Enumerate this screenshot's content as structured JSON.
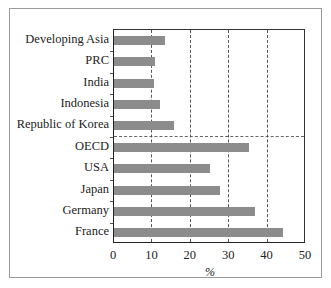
{
  "chart_data": {
    "type": "bar",
    "orientation": "horizontal",
    "title": "",
    "xlabel": "%",
    "ylabel": "",
    "xlim": [
      0,
      50
    ],
    "xticks": [
      0,
      10,
      20,
      30,
      40,
      50
    ],
    "xtick_labels": [
      "0",
      "10",
      "20",
      "30",
      "40",
      "50"
    ],
    "grid": "vertical dashed at 10, 20, 30, 40",
    "separator": "horizontal dashed line between Republic of Korea and OECD",
    "categories": [
      "Developing Asia",
      "PRC",
      "India",
      "Indonesia",
      "Republic of Korea",
      "OECD",
      "USA",
      "Japan",
      "Germany",
      "France"
    ],
    "values": [
      13.3,
      10.7,
      10.4,
      12.0,
      15.5,
      35.2,
      24.9,
      27.7,
      36.8,
      43.9
    ],
    "bar_color": "#8c8c8c"
  }
}
